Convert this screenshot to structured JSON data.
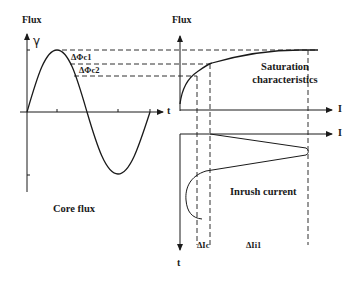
{
  "diagram": {
    "left_panel": {
      "y_axis_label": "Flux",
      "y_symbol": "γ",
      "x_axis_label": "t",
      "caption": "Core flux",
      "annotations": [
        "ΔΦc1",
        "ΔΦc2"
      ]
    },
    "top_right_panel": {
      "y_axis_label": "Flux",
      "x_axis_label": "I",
      "caption_line1": "Saturation",
      "caption_line2": "characteristics"
    },
    "bottom_right_panel": {
      "x_axis_label": "I",
      "y_axis_label": "t",
      "caption": "Inrush current",
      "annotations": [
        "ΔIc",
        "ΔIi1"
      ]
    },
    "colors": {
      "line": "#1a1a1a",
      "background": "#ffffff"
    }
  }
}
